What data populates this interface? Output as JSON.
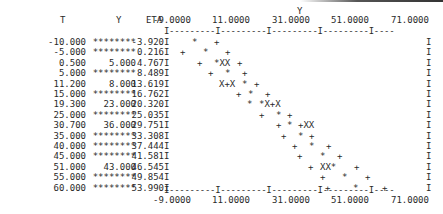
{
  "table": {
    "headers": {
      "t": "T",
      "y": "Y",
      "eta": "ETA",
      "plot_label": "Y"
    },
    "rows": [
      {
        "t": "-10.000",
        "y": "********",
        "eta": "-3.920"
      },
      {
        "t": "-5.000",
        "y": "********",
        "eta": "0.216"
      },
      {
        "t": "0.500",
        "y": "5.000",
        "eta": "4.767"
      },
      {
        "t": "5.000",
        "y": "********",
        "eta": "8.489"
      },
      {
        "t": "11.200",
        "y": "8.000",
        "eta": "13.619"
      },
      {
        "t": "15.000",
        "y": "********",
        "eta": "16.762"
      },
      {
        "t": "19.300",
        "y": "23.000",
        "eta": "20.320"
      },
      {
        "t": "25.000",
        "y": "********",
        "eta": "25.035"
      },
      {
        "t": "30.700",
        "y": "36.000",
        "eta": "29.751"
      },
      {
        "t": "35.000",
        "y": "********",
        "eta": "33.308"
      },
      {
        "t": "40.000",
        "y": "********",
        "eta": "37.444"
      },
      {
        "t": "45.000",
        "y": "********",
        "eta": "41.581"
      },
      {
        "t": "51.000",
        "y": "43.000",
        "eta": "46.545"
      },
      {
        "t": "55.000",
        "y": "********",
        "eta": "49.854"
      },
      {
        "t": "60.000",
        "y": "********",
        "eta": "53.990"
      }
    ]
  },
  "axis": {
    "ticks": [
      "-9.0000",
      "11.0000",
      "31.0000",
      "51.0000",
      "71.0000"
    ],
    "line": "I---------I---------I---------I---------I----",
    "left_border": "I",
    "right_border": "I"
  },
  "plot_rows": [
    [
      {
        "x": 192,
        "s": "*"
      },
      {
        "x": 214,
        "s": "+"
      }
    ],
    [
      {
        "x": 180,
        "s": "+"
      },
      {
        "x": 203,
        "s": "*"
      },
      {
        "x": 225,
        "s": "+"
      }
    ],
    [
      {
        "x": 197,
        "s": "+"
      },
      {
        "x": 214,
        "s": "*XX"
      },
      {
        "x": 237,
        "s": "+"
      }
    ],
    [
      {
        "x": 208,
        "s": "+"
      },
      {
        "x": 225,
        "s": "*"
      },
      {
        "x": 242,
        "s": "+"
      }
    ],
    [
      {
        "x": 219,
        "s": "X+X"
      },
      {
        "x": 242,
        "s": "*"
      },
      {
        "x": 254,
        "s": "+"
      }
    ],
    [
      {
        "x": 236,
        "s": "+"
      },
      {
        "x": 248,
        "s": "*"
      },
      {
        "x": 265,
        "s": "+"
      }
    ],
    [
      {
        "x": 247,
        "s": "*"
      },
      {
        "x": 259,
        "s": "*X+X"
      }
    ],
    [
      {
        "x": 259,
        "s": "+"
      },
      {
        "x": 276,
        "s": "*"
      },
      {
        "x": 287,
        "s": "+"
      }
    ],
    [
      {
        "x": 276,
        "s": "+"
      },
      {
        "x": 287,
        "s": "*"
      },
      {
        "x": 298,
        "s": "+XX"
      }
    ],
    [
      {
        "x": 281,
        "s": "+"
      },
      {
        "x": 298,
        "s": "*"
      },
      {
        "x": 309,
        "s": "+"
      }
    ],
    [
      {
        "x": 292,
        "s": "+"
      },
      {
        "x": 309,
        "s": "*"
      },
      {
        "x": 326,
        "s": "+"
      }
    ],
    [
      {
        "x": 297,
        "s": "+"
      },
      {
        "x": 320,
        "s": "*"
      },
      {
        "x": 337,
        "s": "+"
      }
    ],
    [
      {
        "x": 308,
        "s": "+"
      },
      {
        "x": 320,
        "s": "XX*"
      },
      {
        "x": 354,
        "s": "+"
      }
    ],
    [
      {
        "x": 320,
        "s": "+"
      },
      {
        "x": 342,
        "s": "*"
      },
      {
        "x": 365,
        "s": "+"
      }
    ],
    [
      {
        "x": 325,
        "s": "+"
      },
      {
        "x": 353,
        "s": "*"
      },
      {
        "x": 382,
        "s": "+"
      }
    ]
  ],
  "chart_data": {
    "type": "scatter",
    "title": "",
    "xlabel": "Y",
    "ylabel": "T",
    "xlim": [
      -9,
      75
    ],
    "x_ticks": [
      -9,
      11,
      31,
      51,
      71
    ],
    "categories": [
      "-10.000",
      "-5.000",
      "0.500",
      "5.000",
      "11.200",
      "15.000",
      "19.300",
      "25.000",
      "30.700",
      "35.000",
      "40.000",
      "45.000",
      "51.000",
      "55.000",
      "60.000"
    ],
    "series": [
      {
        "name": "ETA (*)",
        "values": [
          -3.92,
          0.216,
          4.767,
          8.489,
          13.619,
          16.762,
          20.32,
          25.035,
          29.751,
          33.308,
          37.444,
          41.581,
          46.545,
          49.854,
          53.99
        ]
      },
      {
        "name": "Y observed",
        "values": [
          null,
          null,
          5.0,
          null,
          8.0,
          null,
          23.0,
          null,
          36.0,
          null,
          null,
          null,
          43.0,
          null,
          null
        ]
      },
      {
        "name": "confidence band (+)",
        "note": "lower/upper '+' markers around ETA per row"
      }
    ],
    "legend": "none",
    "grid": false
  }
}
